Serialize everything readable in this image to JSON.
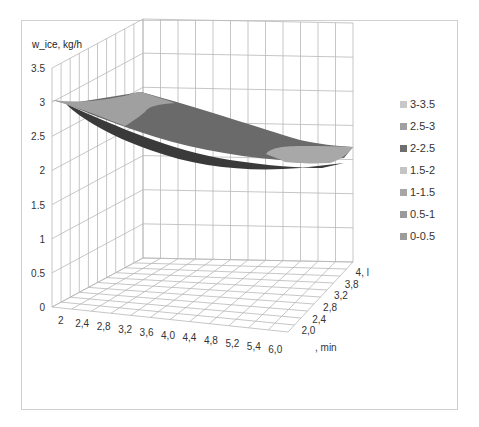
{
  "chart_data": {
    "type": "surface3d",
    "title": "",
    "zlabel": "w_ice, kg/h",
    "xlabel": ", min",
    "ylabel": ", l",
    "zlim": [
      0,
      3.5
    ],
    "z_ticks": [
      "0",
      "0.5",
      "1",
      "1.5",
      "2",
      "2.5",
      "3",
      "3.5"
    ],
    "x_ticks": [
      "2",
      "2,4",
      "2,8",
      "3,2",
      "3,6",
      "4,0",
      "4,4",
      "4,8",
      "5,2",
      "5,4",
      "6,0"
    ],
    "y_ticks": [
      "2,0",
      "2,4",
      "2,8",
      "3,2",
      "3,8",
      "4, l"
    ],
    "grid": true,
    "legend_position": "right",
    "legend": [
      {
        "label": "3-3.5",
        "color": "#c8c8c8"
      },
      {
        "label": "2.5-3",
        "color": "#a0a0a0"
      },
      {
        "label": "2-2.5",
        "color": "#6e6e6e"
      },
      {
        "label": "1.5-2",
        "color": "#c4c4c4"
      },
      {
        "label": "1-1.5",
        "color": "#a6a6a6"
      },
      {
        "label": "0.5-1",
        "color": "#9a9a9a"
      },
      {
        "label": "0-0.5",
        "color": "#9c9c9c"
      }
    ],
    "surface_description": "Surface decreasing from ~2.95 at x=2 to ~2.2 at x=6.0; upper-left region in 2.5-3 band, main body in 2-2.5 band, lowest far-right patch in 2.5-3 shading band (rendered lighter)",
    "approx_values": {
      "x": [
        2,
        2.4,
        2.8,
        3.2,
        3.6,
        4.0,
        4.4,
        4.8,
        5.2,
        5.4,
        6.0
      ],
      "z_front": [
        2.95,
        2.8,
        2.65,
        2.55,
        2.45,
        2.4,
        2.35,
        2.3,
        2.25,
        2.22,
        2.2
      ]
    }
  },
  "axis_title": "w_ice, kg/h",
  "x_unit_label": ", min",
  "z_labels": [
    "3.5",
    "3",
    "2.5",
    "2",
    "1.5",
    "1",
    "0.5",
    "0"
  ],
  "x_labels": [
    "2",
    "2,4",
    "2,8",
    "3,2",
    "3,6",
    "4,0",
    "4,4",
    "4,8",
    "5,2",
    "5,4",
    "6,0"
  ],
  "y_labels": [
    "2,0",
    "2,4",
    "2,8",
    "3,2",
    "3,8",
    "4, l"
  ],
  "legend": {
    "items": [
      {
        "label": "3-3.5",
        "color": "#c8c8c8"
      },
      {
        "label": "2.5-3",
        "color": "#a0a0a0"
      },
      {
        "label": "2-2.5",
        "color": "#6e6e6e"
      },
      {
        "label": "1.5-2",
        "color": "#c4c4c4"
      },
      {
        "label": "1-1.5",
        "color": "#a6a6a6"
      },
      {
        "label": "0.5-1",
        "color": "#9a9a9a"
      },
      {
        "label": "0-0.5",
        "color": "#9c9c9c"
      }
    ]
  }
}
